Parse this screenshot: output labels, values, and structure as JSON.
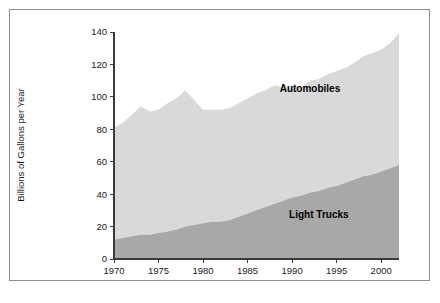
{
  "chart_data": {
    "type": "area",
    "stacked": true,
    "title": "",
    "subtitle": "",
    "xlabel": "",
    "ylabel": "Billions of Gallons per Year",
    "xlim": [
      1970,
      2002
    ],
    "ylim": [
      0,
      140
    ],
    "grid": false,
    "legend_position": "inline-annotation",
    "x_ticks": [
      1970,
      1975,
      1980,
      1985,
      1990,
      1995,
      2000
    ],
    "y_ticks": [
      0,
      20,
      40,
      60,
      80,
      100,
      120,
      140
    ],
    "x": [
      1970,
      1971,
      1972,
      1973,
      1974,
      1975,
      1976,
      1977,
      1978,
      1979,
      1980,
      1981,
      1982,
      1983,
      1984,
      1985,
      1986,
      1987,
      1988,
      1989,
      1990,
      1991,
      1992,
      1993,
      1994,
      1995,
      1996,
      1997,
      1998,
      1999,
      2000,
      2001,
      2002
    ],
    "series": [
      {
        "name": "Light Trucks",
        "color": "#a8a8a8",
        "label_x": 1993,
        "label_y": 25,
        "values": [
          12,
          13,
          14,
          15,
          15,
          16,
          17,
          18,
          20,
          21,
          22,
          23,
          23,
          24,
          26,
          28,
          30,
          32,
          34,
          36,
          38,
          39,
          41,
          42,
          44,
          45,
          47,
          49,
          51,
          52,
          54,
          56,
          58
        ]
      },
      {
        "name": "Automobiles",
        "color": "#d9d9d9",
        "label_x": 1992,
        "label_y": 103,
        "values": [
          69,
          71,
          75,
          79,
          76,
          76,
          79,
          81,
          84,
          77,
          70,
          69,
          69,
          69,
          70,
          71,
          72,
          72,
          73,
          70,
          68,
          67,
          69,
          69,
          70,
          71,
          71,
          72,
          74,
          75,
          75,
          77,
          81
        ]
      }
    ],
    "totals": [
      81,
      84,
      89,
      94,
      91,
      92,
      96,
      99,
      104,
      98,
      92,
      92,
      92,
      93,
      96,
      99,
      102,
      104,
      107,
      106,
      106,
      106,
      110,
      111,
      114,
      116,
      118,
      121,
      125,
      127,
      129,
      133,
      139
    ]
  },
  "chart": {
    "ylabel": "Billions of Gallons per Year",
    "series_labels": {
      "automobiles": "Automobiles",
      "light_trucks": "Light Trucks"
    }
  }
}
